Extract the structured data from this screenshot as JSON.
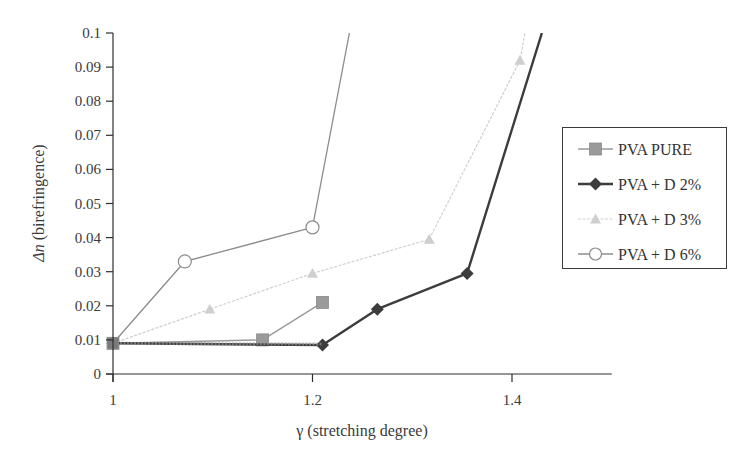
{
  "chart_data": {
    "type": "line",
    "title": "",
    "xlabel": "γ (stretching degree)",
    "ylabel_symbol": "Δn",
    "ylabel_rest": " (birefringence)",
    "ylabel": "Δn (birefringence)",
    "xlim": [
      1,
      1.5
    ],
    "ylim": [
      0,
      0.1
    ],
    "x_ticks": [
      1,
      1.2,
      1.4
    ],
    "x_tick_labels": [
      "1",
      "1.2",
      "1.4"
    ],
    "y_ticks": [
      0,
      0.01,
      0.02,
      0.03,
      0.04,
      0.05,
      0.06,
      0.07,
      0.08,
      0.09,
      0.1
    ],
    "y_tick_labels": [
      "0",
      "0.01",
      "0.02",
      "0.03",
      "0.04",
      "0.05",
      "0.06",
      "0.07",
      "0.08",
      "0.09",
      "0.1"
    ],
    "grid": false,
    "legend_position": "right",
    "series": [
      {
        "name": "PVA PURE",
        "color": "#9a9a9a",
        "marker": "square",
        "x": [
          1.0,
          1.15,
          1.21
        ],
        "y": [
          0.009,
          0.01,
          0.021
        ]
      },
      {
        "name": "PVA + D 2%",
        "color": "#3c3c3c",
        "marker": "diamond",
        "x": [
          1.0,
          1.21,
          1.265,
          1.355,
          1.43
        ],
        "y": [
          0.009,
          0.0085,
          0.019,
          0.0295,
          0.1
        ]
      },
      {
        "name": "PVA + D 3%",
        "color": "#cfcfcf",
        "marker": "triangle",
        "x": [
          1.0,
          1.097,
          1.2,
          1.317,
          1.408,
          1.413
        ],
        "y": [
          0.009,
          0.019,
          0.0295,
          0.0395,
          0.092,
          0.1
        ]
      },
      {
        "name": "PVA + D 6%",
        "color": "#8c8c8c",
        "marker": "circle-open",
        "x": [
          1.0,
          1.072,
          1.2,
          1.237
        ],
        "y": [
          0.009,
          0.033,
          0.043,
          0.1
        ]
      }
    ]
  },
  "legend": {
    "items": [
      {
        "label": "PVA PURE"
      },
      {
        "label": "PVA + D 2%"
      },
      {
        "label": "PVA + D 3%"
      },
      {
        "label": "PVA + D 6%"
      }
    ]
  }
}
